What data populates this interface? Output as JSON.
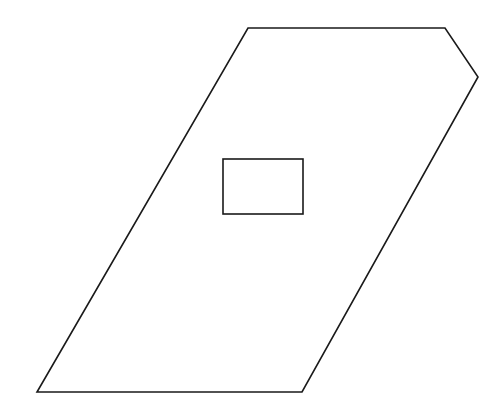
{
  "diagram": {
    "stroke_color": "#1a1a1a",
    "background": "#ffffff",
    "outer_shape": {
      "type": "polygon",
      "points": [
        [
          248,
          28
        ],
        [
          445,
          28
        ],
        [
          478,
          77
        ],
        [
          302,
          392
        ],
        [
          37,
          392
        ]
      ]
    },
    "inner_shape": {
      "type": "rectangle",
      "x": 223,
      "y": 159,
      "width": 80,
      "height": 55
    }
  }
}
